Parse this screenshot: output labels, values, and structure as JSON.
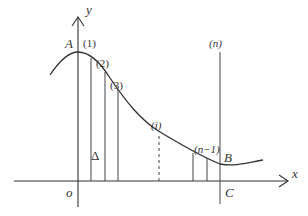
{
  "diagram": {
    "axis_labels": {
      "x": "x",
      "y": "y",
      "origin": "o"
    },
    "points": {
      "A": "A",
      "B": "B",
      "C": "C"
    },
    "strip_labels": {
      "s1": "(1)",
      "s2": "(2)",
      "s3": "(3)",
      "si": "(i)",
      "sn1": "(n−1)",
      "sn": "(n)"
    },
    "delta": "Δ"
  }
}
